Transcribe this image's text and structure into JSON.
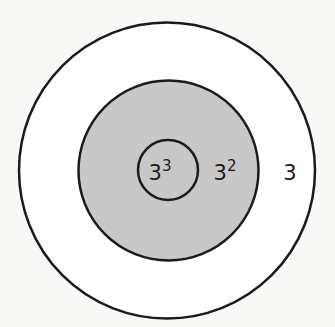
{
  "diagram": {
    "colors": {
      "background": "#f8f8f6",
      "outer_fill": "#ffffff",
      "middle_fill": "#c8c8c8",
      "inner_fill": "#c8c8c8",
      "stroke": "#1a1a1a"
    },
    "rings": [
      {
        "name": "outer",
        "label_base": "3",
        "label_exp": ""
      },
      {
        "name": "middle",
        "label_base": "3",
        "label_exp": "2"
      },
      {
        "name": "inner",
        "label_base": "3",
        "label_exp": "3"
      }
    ]
  }
}
